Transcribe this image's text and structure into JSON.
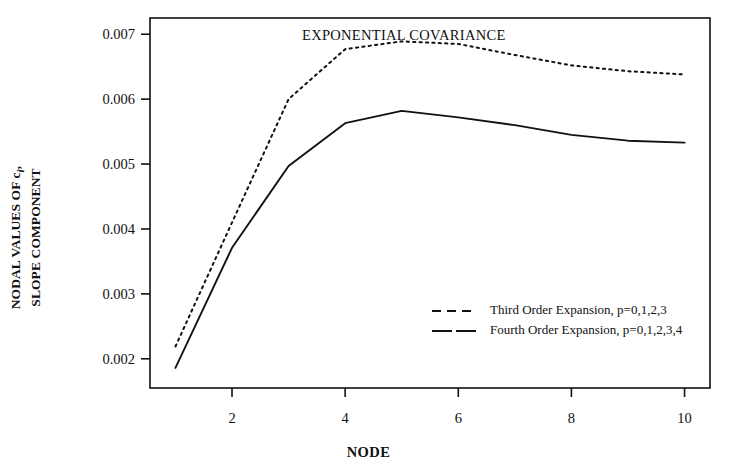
{
  "chart_data": {
    "type": "line",
    "title": "",
    "annotation": "EXPONENTIAL COVARIANCE",
    "xlabel": "NODE",
    "ylabel_line1": "NODAL VALUES OF c",
    "ylabel_sub": "i",
    "ylabel_line1_tail": ",",
    "ylabel_line2": "SLOPE COMPONENT",
    "x": [
      1,
      2,
      3,
      4,
      5,
      6,
      7,
      8,
      9,
      10
    ],
    "xlim": [
      0.55,
      10.45
    ],
    "ylim": [
      0.00155,
      0.00725
    ],
    "xticks": [
      2,
      4,
      6,
      8,
      10
    ],
    "xtick_labels": [
      "2",
      "4",
      "6",
      "8",
      "10"
    ],
    "yticks": [
      0.002,
      0.003,
      0.004,
      0.005,
      0.006,
      0.007
    ],
    "ytick_labels": [
      "0.002",
      "0.003",
      "0.004",
      "0.005",
      "0.006",
      "0.007"
    ],
    "grid": false,
    "legend_position": "lower right",
    "series": [
      {
        "name": "Third Order Expansion, p=0,1,2,3",
        "style": "dashed",
        "color": "#111111",
        "values": [
          0.00219,
          0.0041,
          0.006,
          0.00677,
          0.00689,
          0.00685,
          0.00668,
          0.00652,
          0.00643,
          0.00638
        ]
      },
      {
        "name": "Fourth Order Expansion, p=0,1,2,3,4",
        "style": "solid",
        "color": "#111111",
        "values": [
          0.00186,
          0.00371,
          0.00497,
          0.00563,
          0.00582,
          0.00572,
          0.0056,
          0.00545,
          0.00536,
          0.00533
        ]
      }
    ]
  },
  "legend": {
    "items": [
      {
        "label": "Third Order Expansion, p=0,1,2,3",
        "style": "dashed"
      },
      {
        "label": "Fourth Order Expansion, p=0,1,2,3,4",
        "style": "solid"
      }
    ]
  }
}
